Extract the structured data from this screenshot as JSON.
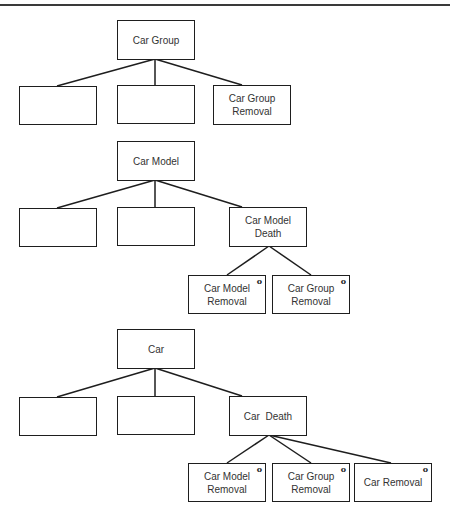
{
  "diagram": {
    "notation": "Jackson structure diagram",
    "selection_marker": "o",
    "line_color": "#1e1e1e",
    "trees": [
      {
        "root": {
          "label": "Car Group"
        },
        "children": [
          {
            "label": ""
          },
          {
            "label": ""
          },
          {
            "label": "Car Group\nRemoval"
          }
        ]
      },
      {
        "root": {
          "label": "Car Model"
        },
        "children": [
          {
            "label": ""
          },
          {
            "label": ""
          },
          {
            "label": "Car Model Death",
            "children": [
              {
                "label": "Car Model\nRemoval",
                "marker": "o"
              },
              {
                "label": "Car Group\nRemoval",
                "marker": "o"
              }
            ]
          }
        ]
      },
      {
        "root": {
          "label": "Car"
        },
        "children": [
          {
            "label": ""
          },
          {
            "label": ""
          },
          {
            "label": "Car  Death",
            "children": [
              {
                "label": "Car Model\nRemoval",
                "marker": "o"
              },
              {
                "label": "Car Group\nRemoval",
                "marker": "o"
              },
              {
                "label": "Car Removal",
                "marker": "o"
              }
            ]
          }
        ]
      }
    ]
  }
}
